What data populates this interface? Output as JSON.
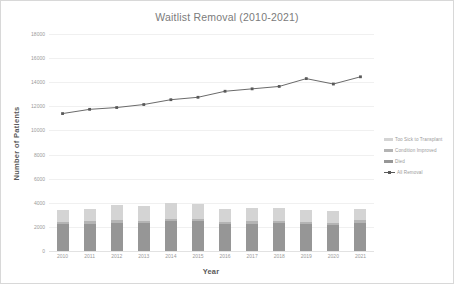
{
  "chart_data": {
    "type": "bar",
    "title": "Waitlist Removal (2010-2021)",
    "xlabel": "Year",
    "ylabel": "Number of Patients",
    "categories": [
      "2010",
      "2011",
      "2012",
      "2013",
      "2014",
      "2015",
      "2016",
      "2017",
      "2018",
      "2019",
      "2020",
      "2021"
    ],
    "ylim": [
      0,
      18000
    ],
    "ytick_values": [
      0,
      2000,
      4000,
      6000,
      8000,
      10000,
      12000,
      14000,
      16000,
      18000
    ],
    "ytick_labels": [
      "0",
      "2000",
      "4000",
      "6000",
      "8000",
      "10000",
      "12000",
      "14000",
      "16000",
      "18000"
    ],
    "grid": true,
    "legend_position": "right",
    "stacked": true,
    "series": [
      {
        "name": "Died",
        "kind": "bar-segment",
        "color": "#969696",
        "values": [
          2200,
          2250,
          2350,
          2300,
          2450,
          2450,
          2200,
          2250,
          2300,
          2250,
          2150,
          2350
        ]
      },
      {
        "name": "Condition Improved",
        "kind": "bar-segment",
        "color": "#b4b4b4",
        "values": [
          200,
          200,
          220,
          210,
          230,
          220,
          200,
          200,
          210,
          190,
          180,
          200
        ]
      },
      {
        "name": "Too Sick to Transplant",
        "kind": "bar-segment",
        "color": "#d4d4d4",
        "values": [
          1000,
          1050,
          1280,
          1240,
          1320,
          1220,
          1080,
          1080,
          1100,
          940,
          970,
          930
        ]
      },
      {
        "name": "All Removal",
        "kind": "line",
        "color": "#595959",
        "values": [
          11400,
          11750,
          11900,
          12150,
          12550,
          12750,
          13250,
          13450,
          13650,
          14300,
          13850,
          14450
        ]
      }
    ]
  },
  "legend": {
    "items": [
      {
        "label": "Too Sick to Transplant",
        "type": "swatch",
        "color": "#d4d4d4"
      },
      {
        "label": "Condition Improved",
        "type": "swatch",
        "color": "#b4b4b4"
      },
      {
        "label": "Died",
        "type": "swatch",
        "color": "#969696"
      },
      {
        "label": "All Removal",
        "type": "line-marker",
        "color": "#595959"
      }
    ]
  }
}
